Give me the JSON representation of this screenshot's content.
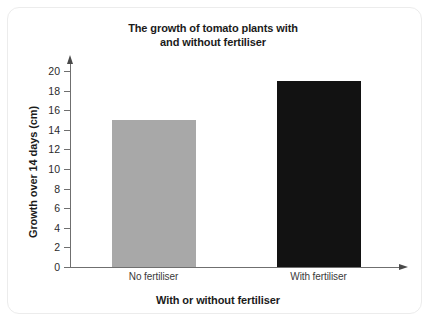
{
  "chart_data": {
    "type": "bar",
    "title": "The growth of tomato plants with and without fertiliser",
    "title_line1": "The growth of tomato plants with",
    "title_line2": "and without fertiliser",
    "xlabel": "With or without fertiliser",
    "ylabel": "Growth over 14 days (cm)",
    "categories": [
      "No fertiliser",
      "With fertiliser"
    ],
    "values": [
      15,
      19
    ],
    "ylim": [
      0,
      20
    ],
    "ytick_step": 2,
    "yticks": [
      0,
      2,
      4,
      6,
      8,
      10,
      12,
      14,
      16,
      18,
      20
    ],
    "ytick_labels": [
      "0",
      "2",
      "4",
      "6",
      "8",
      "10",
      "12",
      "14",
      "16",
      "18",
      "20"
    ],
    "grid": false,
    "legend": null,
    "bar_colors": [
      "#a8a8a8",
      "#121212"
    ],
    "axis_color": "#6f6f6f",
    "series": [
      {
        "name": "Growth over 14 days (cm)",
        "values": [
          15,
          19
        ]
      }
    ]
  },
  "card": {
    "background": "#ffffff",
    "border_color": "#ececec"
  }
}
